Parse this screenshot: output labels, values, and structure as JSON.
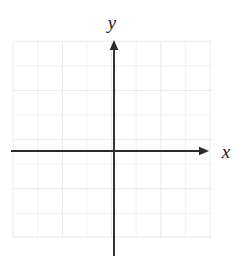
{
  "figure": {
    "kind": "coordinate-plane",
    "background_color": "#ffffff",
    "width": 245,
    "height": 272
  },
  "chart_data": {
    "type": "scatter",
    "title": "",
    "subtitle": "",
    "xlabel": "x",
    "ylabel": "y",
    "x": [],
    "y": [],
    "series": [],
    "annotations": [],
    "grid": true,
    "grid_spacing": 1,
    "legend": "none",
    "xlim": [
      -4.1,
      4.0
    ],
    "ylim": [
      -3.5,
      4.5
    ],
    "xticks": [],
    "yticks": [],
    "tick_labels_shown": false
  },
  "axes": {
    "x_axis": {
      "label": "x",
      "label_x": 226,
      "label_y": 158,
      "line_start_x": 11,
      "line_end_x": 202,
      "line_y": 151,
      "arrow_tip_x": 209,
      "arrow_direction": "right",
      "color": "#2b2b2b",
      "stroke_width": 1.9
    },
    "y_axis": {
      "label": "y",
      "label_x": 112,
      "label_y": 29,
      "line_x": 114,
      "line_start_y": 256,
      "line_end_y": 48,
      "arrow_tip_y": 40,
      "arrow_direction": "up",
      "color": "#2b2b2b",
      "stroke_width": 1.9
    },
    "origin": {
      "x": 114,
      "y": 151
    }
  },
  "grid": {
    "color": "#e9e9e9",
    "stroke_width": 1,
    "cell_size": 24.6,
    "left": 13.2,
    "right": 212.4,
    "top": 41.2,
    "bottom": 237.0,
    "vertical_lines": [
      13.2,
      37.8,
      62.4,
      87.0,
      111.6,
      136.2,
      160.8,
      185.4,
      210.0
    ],
    "horizontal_lines": [
      41.2,
      65.8,
      90.4,
      115.0,
      139.6,
      164.2,
      188.8,
      213.4,
      237.0
    ]
  },
  "colors": {
    "axis": "#2b2b2b",
    "grid": "#e9e9e9",
    "grid_faint": "#f1f1f1",
    "label": "#1a1a1a",
    "background": "#ffffff"
  }
}
